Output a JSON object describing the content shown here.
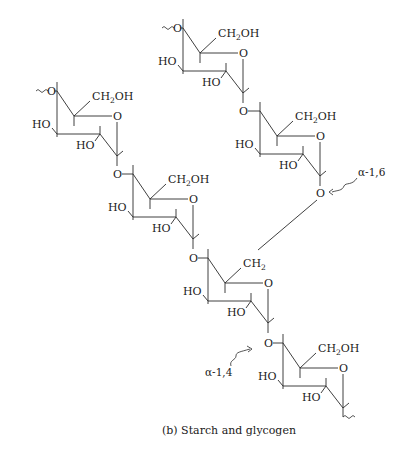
{
  "figure": {
    "caption": "(b) Starch and glycogen"
  },
  "labels": {
    "hydroxymethyl": "CH₂OH",
    "methylene": "CH₂",
    "hydroxyl": "HO",
    "ring_oxygen": "O",
    "bridge_oxygen": "O"
  },
  "annotations": {
    "branch_link": "α-1,6",
    "chain_link": "α-1,4"
  },
  "residues": [
    {
      "id": "glc-1",
      "substituent": "CH₂OH",
      "chain": "branch",
      "note": "branch start, continues ~O"
    },
    {
      "id": "glc-2",
      "substituent": "CH₂OH",
      "chain": "branch"
    },
    {
      "id": "glc-3",
      "substituent": "CH₂OH",
      "chain": "main",
      "note": "main start, continues ~O"
    },
    {
      "id": "glc-4",
      "substituent": "CH₂OH",
      "chain": "main"
    },
    {
      "id": "glc-5",
      "substituent": "CH₂",
      "chain": "main",
      "note": "branch point via α-1,6"
    },
    {
      "id": "glc-6",
      "substituent": "CH₂OH",
      "chain": "main",
      "note": "continues ~"
    }
  ],
  "colors": {
    "ink": "#1a1a1a",
    "background": "#ffffff"
  }
}
